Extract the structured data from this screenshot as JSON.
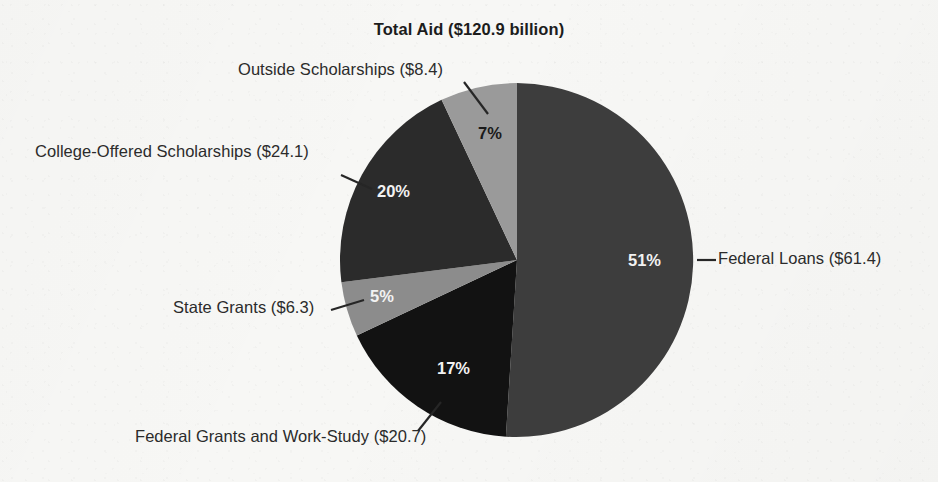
{
  "chart_data": {
    "type": "pie",
    "title": "Total Aid ($120.9 billion)",
    "total": 120.9,
    "units": "billion USD",
    "legend_position": "callout-labels",
    "grid": false,
    "categories": [
      "Federal Loans",
      "Federal Grants and Work-Study",
      "State Grants",
      "College-Offered Scholarships",
      "Outside Scholarships"
    ],
    "values": [
      61.4,
      20.7,
      6.3,
      24.1,
      8.4
    ],
    "percentages": [
      51,
      17,
      5,
      20,
      7
    ],
    "slices": [
      {
        "name": "Federal Loans",
        "value": 61.4,
        "percent": 51,
        "percent_label": "51%",
        "callout_label": "Federal Loans ($61.4)",
        "color": "#3d3d3d",
        "label_color": "#f2f2f2"
      },
      {
        "name": "Federal Grants and Work-Study",
        "value": 20.7,
        "percent": 17,
        "percent_label": "17%",
        "callout_label": "Federal Grants and Work-Study ($20.7)",
        "color": "#121212",
        "label_color": "#f2f2f2"
      },
      {
        "name": "State Grants",
        "value": 6.3,
        "percent": 5,
        "percent_label": "5%",
        "callout_label": "State Grants ($6.3)",
        "color": "#8c8c8c",
        "label_color": "#f2f2f2"
      },
      {
        "name": "College-Offered Scholarships",
        "value": 24.1,
        "percent": 20,
        "percent_label": "20%",
        "callout_label": "College-Offered Scholarships ($24.1)",
        "color": "#2b2b2b",
        "label_color": "#f2f2f2"
      },
      {
        "name": "Outside Scholarships",
        "value": 8.4,
        "percent": 7,
        "percent_label": "7%",
        "callout_label": "Outside Scholarships ($8.4)",
        "color": "#9a9a9a",
        "label_color": "#1a1a1a"
      }
    ]
  },
  "colors": {
    "background": "#f7f7f5",
    "text": "#2b2b2b",
    "title": "#1c1c1c",
    "leader_line": "#262626"
  }
}
